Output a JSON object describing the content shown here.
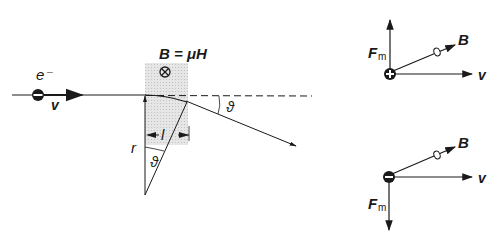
{
  "diagram": {
    "colors": {
      "ink": "#1a1a1a",
      "field_region": "#dcdcdc",
      "background": "#ffffff"
    },
    "left_panel": {
      "particle_label": "e⁻",
      "particle_sign": "−",
      "velocity_label": "v",
      "field_label": "B = μH",
      "field_symbol": "⊗",
      "field_direction": "into page",
      "radius_label": "r",
      "length_label": "l",
      "angle_label_center": "ϑ",
      "angle_label_exit": "ϑ"
    },
    "right_panel": {
      "positive_charge": {
        "sign": "+",
        "force_label": "F",
        "force_subscript": "m",
        "force_direction": "up",
        "field_label": "B",
        "velocity_label": "v"
      },
      "negative_charge": {
        "sign": "−",
        "force_label": "F",
        "force_subscript": "m",
        "force_direction": "down",
        "field_label": "B",
        "velocity_label": "v"
      }
    }
  }
}
